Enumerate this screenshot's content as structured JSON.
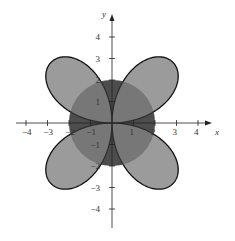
{
  "chart_data": {
    "type": "polar-plot",
    "title": "",
    "xlabel": "x",
    "ylabel": "y",
    "xlim": [
      -4.5,
      4.5
    ],
    "ylim": [
      -4.5,
      4.5
    ],
    "x_ticks": [
      -4,
      -3,
      -2,
      -1,
      1,
      2,
      3,
      4
    ],
    "y_ticks": [
      -4,
      -3,
      -2,
      -1,
      1,
      2,
      3,
      4
    ],
    "series": [
      {
        "name": "circle",
        "equation": "r = 2"
      },
      {
        "name": "four-leaved rose",
        "equation": "r = 4 sin 2θ"
      }
    ],
    "shaded": "regions inside both curves (darker) and inside either curve"
  },
  "labels": {
    "x": "x",
    "y": "y",
    "xt": [
      "−4",
      "−3",
      "−2",
      "−1",
      "1",
      "2",
      "3",
      "4"
    ],
    "yt": [
      "4",
      "3",
      "2",
      "1",
      "−1",
      "−2",
      "−3",
      "−4"
    ]
  }
}
